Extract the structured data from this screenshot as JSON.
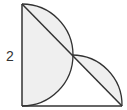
{
  "diagram": {
    "type": "geometry",
    "label_side": "2",
    "colors": {
      "stroke": "#333333",
      "shade": "#efefef",
      "background": "#ffffff"
    }
  }
}
